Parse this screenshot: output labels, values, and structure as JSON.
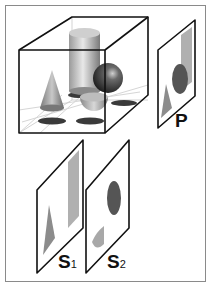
{
  "figure": {
    "type": "projection-diagram",
    "box": {
      "objects": [
        "cone",
        "cylinder",
        "sphere",
        "hemisphere"
      ]
    },
    "planes": [
      {
        "id": "P",
        "label": "P",
        "shows": [
          "triangle",
          "ellipse",
          "rectangle"
        ]
      },
      {
        "id": "S1",
        "label_main": "S",
        "label_sub": "1",
        "shows": [
          "triangle",
          "rectangle"
        ]
      },
      {
        "id": "S2",
        "label_main": "S",
        "label_sub": "2",
        "shows": [
          "ellipse",
          "half-disc"
        ]
      }
    ]
  },
  "colors": {
    "border": "#8a8a8a",
    "edge": "#111111",
    "shape_light": "#a8a8a8",
    "shape_dark": "#555555",
    "shadow": "#3a3a3a"
  }
}
